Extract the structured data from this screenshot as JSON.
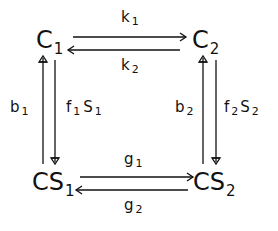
{
  "diagram": {
    "type": "kinetic-state-scheme",
    "nodes": [
      {
        "id": "C1",
        "base": "C",
        "sub": "1"
      },
      {
        "id": "C2",
        "base": "C",
        "sub": "2"
      },
      {
        "id": "CS1",
        "base": "CS",
        "sub": "1"
      },
      {
        "id": "CS2",
        "base": "CS",
        "sub": "2"
      }
    ],
    "edges": [
      {
        "from": "C1",
        "to": "C2",
        "label_base": "k",
        "label_sub": "1"
      },
      {
        "from": "C2",
        "to": "C1",
        "label_base": "k",
        "label_sub": "2"
      },
      {
        "from": "CS1",
        "to": "CS2",
        "label_base": "g",
        "label_sub": "1"
      },
      {
        "from": "CS2",
        "to": "CS1",
        "label_base": "g",
        "label_sub": "2"
      },
      {
        "from": "CS1",
        "to": "C1",
        "label_base": "b",
        "label_sub": "1"
      },
      {
        "from": "C1",
        "to": "CS1",
        "label_f": "f",
        "label_f_sub": "1",
        "label_s": "S",
        "label_s_sub": "1"
      },
      {
        "from": "CS2",
        "to": "C2",
        "label_base": "b",
        "label_sub": "2"
      },
      {
        "from": "C2",
        "to": "CS2",
        "label_f": "f",
        "label_f_sub": "2",
        "label_s": "S",
        "label_s_sub": "2"
      }
    ],
    "stroke_color": "#111111"
  }
}
